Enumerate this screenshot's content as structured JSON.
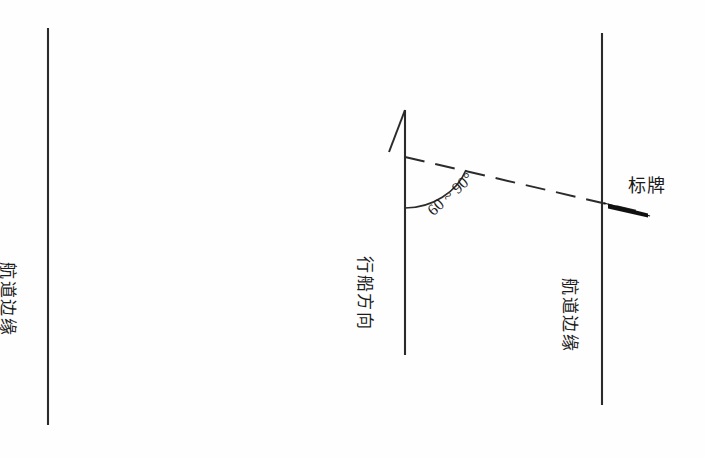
{
  "diagram": {
    "background_color": "#fefefe",
    "line_color": "#2b2b2b",
    "sign_color": "#111111",
    "labels": {
      "left_channel_edge": "航道边缘",
      "right_channel_edge": "航道边缘",
      "sail_direction": "行船方向",
      "angle_range": "60 ~ 90°",
      "sign": "标牌"
    },
    "elements": {
      "left_edge_line_name": "left-channel-edge-line",
      "middle_axis_line_name": "sail-direction-axis-line",
      "right_edge_line_name": "right-channel-edge-line",
      "dashed_sight_line_name": "sign-alignment-dashed-line",
      "angle_arc_name": "angle-arc",
      "direction_arrowhead_name": "direction-arrowhead",
      "sign_bar_name": "sign-bar"
    },
    "geometry": {
      "left_line": {
        "x": 48,
        "y_top": 28,
        "y_bottom": 425
      },
      "middle_line": {
        "x": 405,
        "y_top": 110,
        "y_bottom": 355
      },
      "right_line": {
        "x": 602,
        "y_top": 33,
        "y_bottom": 405
      },
      "dashed_line": {
        "x1": 405,
        "y1": 157,
        "x2": 636,
        "y2": 211
      },
      "angle_arc": {
        "start_x": 405,
        "start_y": 208,
        "end_x": 466,
        "end_y": 170
      },
      "arrowhead_apex": {
        "x": 405,
        "y": 110
      },
      "sign_bar": {
        "x1": 608,
        "y1": 205,
        "x2": 648,
        "y2": 216
      }
    }
  }
}
